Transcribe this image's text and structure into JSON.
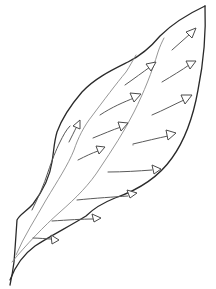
{
  "figure": {
    "caption_fragment": "",
    "colors": {
      "background": "#ffffff",
      "outline": "#2a2a2a",
      "vein": "#8a8a8a",
      "arrow": "#5a5a5a"
    },
    "arrow_count": 14,
    "arrows": [
      {
        "id": "arrow-1",
        "from": [
          172,
          50
        ],
        "to": [
          195,
          30
        ]
      },
      {
        "id": "arrow-2",
        "from": [
          162,
          82
        ],
        "to": [
          195,
          62
        ]
      },
      {
        "id": "arrow-3",
        "from": [
          125,
          85
        ],
        "to": [
          155,
          63
        ]
      },
      {
        "id": "arrow-4",
        "from": [
          150,
          115
        ],
        "to": [
          190,
          97
        ]
      },
      {
        "id": "arrow-5",
        "from": [
          100,
          115
        ],
        "to": [
          140,
          95
        ]
      },
      {
        "id": "arrow-6",
        "from": [
          133,
          144
        ],
        "to": [
          175,
          135
        ]
      },
      {
        "id": "arrow-7",
        "from": [
          93,
          137
        ],
        "to": [
          128,
          125
        ]
      },
      {
        "id": "arrow-8",
        "from": [
          108,
          171
        ],
        "to": [
          160,
          169
        ]
      },
      {
        "id": "arrow-9",
        "from": [
          78,
          160
        ],
        "to": [
          105,
          148
        ]
      },
      {
        "id": "arrow-10",
        "from": [
          77,
          200
        ],
        "to": [
          136,
          195
        ]
      },
      {
        "id": "arrow-11",
        "from": [
          52,
          220
        ],
        "to": [
          100,
          218
        ]
      },
      {
        "id": "arrow-12",
        "from": [
          33,
          238
        ],
        "to": [
          58,
          240
        ]
      },
      {
        "id": "arrow-13",
        "from": [
          70,
          138
        ],
        "to": [
          80,
          122
        ]
      },
      {
        "id": "arrow-14",
        "from": [
          165,
          197
        ],
        "to": [
          165,
          197
        ]
      }
    ]
  }
}
